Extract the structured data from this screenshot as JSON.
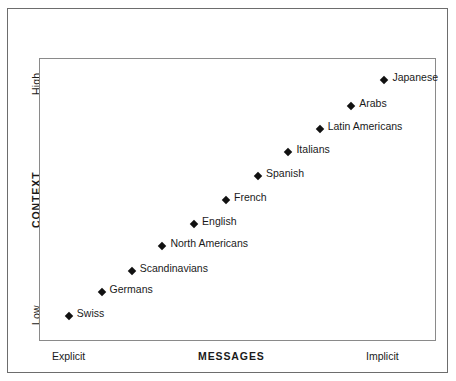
{
  "chart_data": {
    "type": "scatter",
    "title": "",
    "xlabel": "MESSAGES",
    "ylabel": "CONTEXT",
    "xtick_labels": [
      "Explicit",
      "Implicit"
    ],
    "ytick_labels": [
      "Low",
      "High"
    ],
    "xlim": [
      0,
      100
    ],
    "ylim": [
      0,
      100
    ],
    "grid": false,
    "legend": "none",
    "marker_color": "#111111",
    "frame_color": "#6d6d6d",
    "plot_border_color": "#8a8a8a",
    "points": [
      {
        "label": "Japanese",
        "x": 87.2,
        "y": 92.6
      },
      {
        "label": "Arabs",
        "x": 78.8,
        "y": 83.4
      },
      {
        "label": "Latin Americans",
        "x": 70.8,
        "y": 75.0
      },
      {
        "label": "Italians",
        "x": 62.9,
        "y": 66.8
      },
      {
        "label": "Spanish",
        "x": 55.2,
        "y": 58.3
      },
      {
        "label": "French",
        "x": 47.1,
        "y": 49.9
      },
      {
        "label": "English",
        "x": 39.0,
        "y": 41.4
      },
      {
        "label": "North Americans",
        "x": 31.0,
        "y": 33.6
      },
      {
        "label": "Scandinavians",
        "x": 23.2,
        "y": 24.4
      },
      {
        "label": "Germans",
        "x": 15.6,
        "y": 17.2
      },
      {
        "label": "Swiss",
        "x": 7.3,
        "y": 8.4
      }
    ]
  },
  "axes": {
    "y_title": "CONTEXT",
    "y_high": "High",
    "y_low": "Low",
    "x_title": "MESSAGES",
    "x_left": "Explicit",
    "x_right": "Implicit"
  }
}
